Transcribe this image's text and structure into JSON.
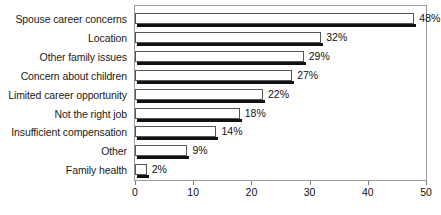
{
  "chart_data": {
    "type": "bar",
    "orientation": "horizontal",
    "title": "",
    "subtitle": "",
    "xlabel": "",
    "ylabel": "",
    "xlim": [
      0,
      50
    ],
    "ylim": null,
    "grid": false,
    "legend": null,
    "xticks": [
      0,
      10,
      20,
      30,
      40,
      50
    ],
    "xtick_labels": [
      "0",
      "10",
      "20",
      "30",
      "40",
      "50"
    ],
    "categories": [
      "Spouse career concerns",
      "Location",
      "Other family issues",
      "Concern about children",
      "Limited career opportunity",
      "Not the right job",
      "Insufficient compensation",
      "Other",
      "Family health"
    ],
    "values": [
      48,
      32,
      29,
      27,
      22,
      18,
      14,
      9,
      2
    ],
    "value_labels": [
      "48%",
      "32%",
      "29%",
      "27%",
      "22%",
      "18%",
      "14%",
      "9%",
      "2%"
    ],
    "colors": {
      "bar_fill": "#ffffff",
      "bar_edge": "#555555",
      "bar_shadow": "#111111",
      "frame": "#9a9a9a",
      "text": "#111111",
      "background": "#ffffff"
    }
  }
}
